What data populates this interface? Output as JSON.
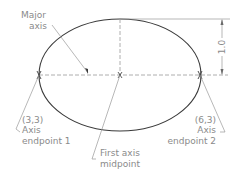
{
  "diagram": {
    "labels": {
      "major_axis_line1": "Major",
      "major_axis_line2": "axis",
      "endpoint1_coord": "(3,3)",
      "endpoint1_line1": "Axis",
      "endpoint1_line2": "endpoint  1",
      "endpoint2_coord": "(6,3)",
      "endpoint2_line1": "Axis",
      "endpoint2_line2": "endpoint  2",
      "midpoint_line1": "First  axis",
      "midpoint_line2": "midpoint",
      "dimension_value": "1.0"
    },
    "colors": {
      "ellipse": "#3a3a3a",
      "construction": "#9a9a9a",
      "text": "#8a8a8a"
    }
  }
}
